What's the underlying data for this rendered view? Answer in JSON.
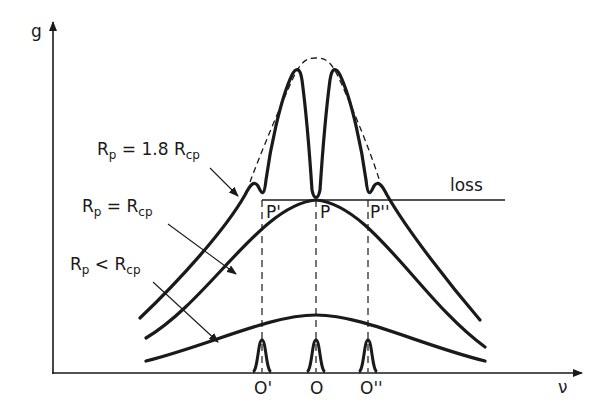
{
  "figure": {
    "y_axis_label": "g",
    "x_axis_label": "ν",
    "loss_label": "loss",
    "curves": [
      {
        "id": "top",
        "label_main": "R",
        "label_sub": "p",
        "label_rel": " = 1.8 R",
        "label_sub2": "cp"
      },
      {
        "id": "middle",
        "label_main": "R",
        "label_sub": "p",
        "label_rel": " = R",
        "label_sub2": "cp"
      },
      {
        "id": "bottom",
        "label_main": "R",
        "label_sub": "p",
        "label_rel": " < R",
        "label_sub2": "cp"
      }
    ],
    "points": {
      "p_left": "P'",
      "p_center": "P",
      "p_right": "P''"
    },
    "modes": {
      "o_left": "O'",
      "o_center": "O",
      "o_right": "O''"
    },
    "colors": {
      "ink": "#1a1a1a",
      "background": "#ffffff"
    }
  }
}
